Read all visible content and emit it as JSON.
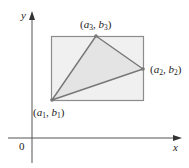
{
  "diagram": {
    "type": "coordinate-geometry",
    "axes": {
      "x_label": "x",
      "y_label": "y",
      "origin_label": "0"
    },
    "rectangle": {
      "fill": "#f0f0f0",
      "stroke": "#8c8c8c"
    },
    "triangle": {
      "fill": "#e4e4e4",
      "stroke": "#777777",
      "vertices": [
        {
          "id": "P1",
          "a": "a",
          "a_sub": "1",
          "b": "b",
          "b_sub": "1"
        },
        {
          "id": "P2",
          "a": "a",
          "a_sub": "2",
          "b": "b",
          "b_sub": "2"
        },
        {
          "id": "P3",
          "a": "a",
          "a_sub": "3",
          "b": "b",
          "b_sub": "3"
        }
      ]
    }
  }
}
